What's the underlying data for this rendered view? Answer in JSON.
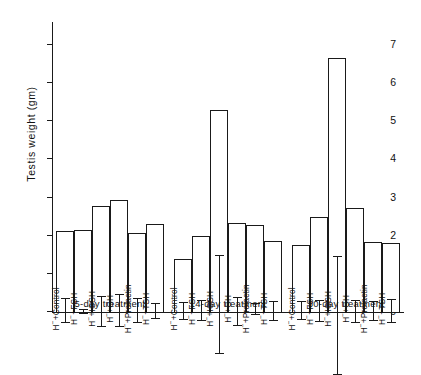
{
  "chart_data": {
    "type": "bar",
    "title": "",
    "xlabel": "",
    "ylabel": "Testis  weight  (gm)",
    "ylim": [
      0,
      7.6
    ],
    "yticks": [
      0,
      1,
      2,
      3,
      4,
      5,
      6,
      7
    ],
    "ytick_labels": [
      "0",
      "1",
      "2",
      "3",
      "4",
      "5",
      "6",
      "7"
    ],
    "grid": false,
    "legend": "none",
    "categories": [
      "H⁻+Control",
      "H⁻+FSH",
      "H⁻+ICSH",
      "H⁻+GH",
      "H⁻+Prolactin",
      "H⁻+TSH"
    ],
    "groups": [
      {
        "name": "5-day  treatment",
        "bars": [
          {
            "label": "H⁻+Control",
            "value": 2.12,
            "err_low": 1.83,
            "err_high": 2.45
          },
          {
            "label": "H⁻+FSH",
            "value": 2.16,
            "err_low": 2.1,
            "err_high": 2.22
          },
          {
            "label": "H⁻+ICSH",
            "value": 2.77,
            "err_low": 2.37,
            "err_high": 3.17
          },
          {
            "label": "H⁻+GH",
            "value": 2.93,
            "err_low": 2.54,
            "err_high": 3.37
          },
          {
            "label": "H⁻+Prolactin",
            "value": 2.07,
            "err_low": 1.77,
            "err_high": 2.4
          },
          {
            "label": "H⁻+TSH",
            "value": 2.3,
            "err_low": 2.11,
            "err_high": 2.5
          }
        ]
      },
      {
        "name": "14-day  treatment",
        "bars": [
          {
            "label": "H⁻+Control",
            "value": 1.4,
            "err_low": 1.2,
            "err_high": 1.63
          },
          {
            "label": "H⁻+FSH",
            "value": 2.0,
            "err_low": 1.77,
            "err_high": 2.29
          },
          {
            "label": "H⁻+ICSH",
            "value": 5.3,
            "err_low": 4.2,
            "err_high": 6.78
          },
          {
            "label": "H⁻+GH",
            "value": 2.34,
            "err_low": 1.97,
            "err_high": 2.7
          },
          {
            "label": "H⁻+Prolactin",
            "value": 2.29,
            "err_low": 2.2,
            "err_high": 2.5
          },
          {
            "label": "H⁻+TSH",
            "value": 1.86,
            "err_low": 1.63,
            "err_high": 2.11
          }
        ]
      },
      {
        "name": "30-day  treatment",
        "bars": [
          {
            "label": "H⁻+Control",
            "value": 1.75,
            "err_low": 1.54,
            "err_high": 2.0
          },
          {
            "label": "H⁻+FSH",
            "value": 2.5,
            "err_low": 2.23,
            "err_high": 2.8
          },
          {
            "label": "H⁻+ICSH",
            "value": 6.65,
            "err_low": 5.0,
            "err_high": 8.1
          },
          {
            "label": "H⁻+GH",
            "value": 2.73,
            "err_low": 2.43,
            "err_high": 3.03
          },
          {
            "label": "H⁻+Prolactin",
            "value": 1.83,
            "err_low": 1.6,
            "err_high": 2.09
          },
          {
            "label": "H⁻+TSH",
            "value": 1.8,
            "err_low": 1.5,
            "err_high": 2.12
          }
        ]
      }
    ]
  },
  "colors": {
    "ink": "#1a1a1a",
    "background": "#ffffff",
    "bar_fill": "#ffffff"
  }
}
